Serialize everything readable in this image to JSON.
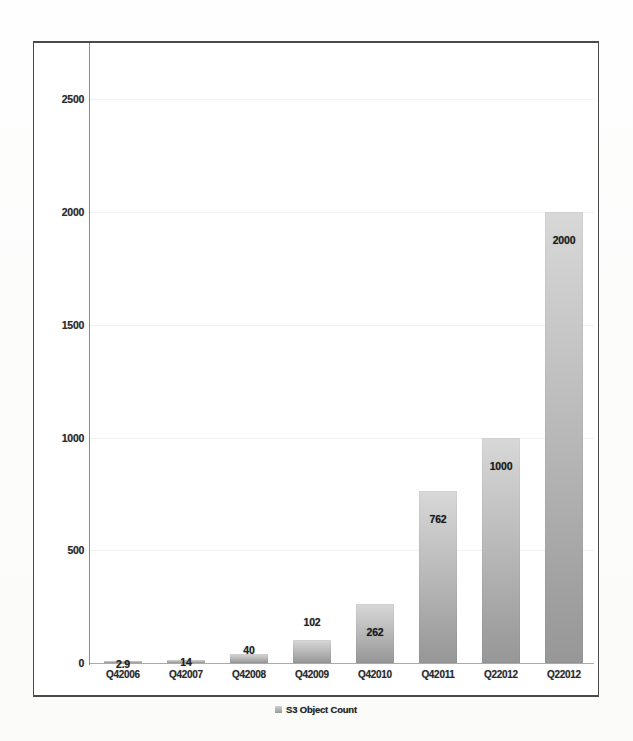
{
  "chart_data": {
    "type": "bar",
    "title": "",
    "subtitle": "",
    "xlabel": "",
    "ylabel": "",
    "categories": [
      "Q42006",
      "Q42007",
      "Q42008",
      "Q42009",
      "Q42010",
      "Q42011",
      "Q22012",
      "Q22012"
    ],
    "values": [
      2.9,
      14,
      40,
      102,
      262,
      762,
      1000,
      2000
    ],
    "data_labels": [
      "2.9",
      "14",
      "40",
      "102",
      "262",
      "762",
      "1000",
      "2000"
    ],
    "series": [
      {
        "name": "S3 Object Count",
        "values": [
          2.9,
          14,
          40,
          102,
          262,
          762,
          1000,
          2000
        ]
      }
    ],
    "ylim": [
      0,
      2500
    ],
    "yticks": [
      0,
      500,
      1000,
      1500,
      2000,
      2500
    ],
    "ytick_labels": [
      "0",
      "500",
      "1000",
      "1500",
      "2000",
      "2500"
    ],
    "grid": false,
    "legend": {
      "position": "bottom",
      "entries": [
        {
          "label": "S3 Object Count",
          "marker": "legend-swatch",
          "color": "#b0b0b0"
        }
      ]
    },
    "colors": {
      "bar_top": "#d8d8d8",
      "bar_bottom": "#979797",
      "frame": "#4a4a4a",
      "axis": "#8d8d8d",
      "text": "#1f1f1f",
      "background": "#ffffff"
    }
  }
}
